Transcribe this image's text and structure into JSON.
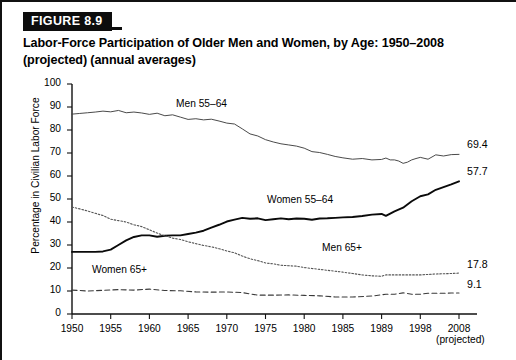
{
  "figure": {
    "badge": "FIGURE 8.9",
    "title_line1": "Labor-Force Participation of Older Men and Women, by Age: 1950–2008",
    "title_line2": "(projected) (annual averages)"
  },
  "chart_data": {
    "type": "line",
    "title": "Labor-Force Participation of Older Men and Women, by Age: 1950–2008 (projected) (annual averages)",
    "xlabel": "",
    "ylabel": "Percentage in Civilian Labor Force",
    "ylim": [
      0,
      100
    ],
    "yticks": [
      0,
      10,
      20,
      30,
      40,
      50,
      60,
      70,
      80,
      90,
      100
    ],
    "xtick_labels": [
      "1950",
      "1955",
      "1960",
      "1965",
      "1970",
      "1975",
      "1980",
      "1985",
      "1989",
      "1998",
      "2008"
    ],
    "xtick_sublabel_last": "(projected)",
    "grid": false,
    "legend": "inline-labels",
    "series": [
      {
        "name": "Men 55–64",
        "style": "solid-thin",
        "color": "#404040",
        "end_value": 69.4,
        "label_position": "inline",
        "x": [
          1950,
          1951,
          1952,
          1953,
          1954,
          1955,
          1956,
          1957,
          1958,
          1959,
          1960,
          1961,
          1962,
          1963,
          1964,
          1965,
          1966,
          1967,
          1968,
          1969,
          1970,
          1971,
          1972,
          1973,
          1974,
          1975,
          1976,
          1977,
          1978,
          1979,
          1980,
          1981,
          1982,
          1983,
          1984,
          1985,
          1986,
          1987,
          1988,
          1989,
          1990,
          1991,
          1992,
          1993,
          1994,
          1995,
          1996,
          1997,
          1998,
          2000,
          2002,
          2004,
          2006,
          2008
        ],
        "values": [
          86.9,
          87.2,
          87.5,
          87.8,
          88.2,
          87.9,
          88.5,
          87.5,
          87.8,
          87.4,
          86.8,
          87.3,
          86.2,
          86.6,
          85.6,
          84.6,
          84.9,
          84.4,
          84.7,
          83.9,
          83.0,
          82.6,
          80.5,
          78.3,
          77.4,
          75.8,
          74.8,
          74.0,
          73.5,
          73.0,
          72.1,
          70.6,
          70.2,
          69.4,
          68.5,
          67.9,
          67.3,
          67.6,
          67.0,
          67.2,
          67.8,
          67.0,
          67.0,
          66.5,
          65.5,
          66.0,
          67.0,
          67.6,
          68.1,
          67.3,
          69.2,
          68.7,
          69.3,
          69.4
        ]
      },
      {
        "name": "Women 55–64",
        "style": "solid-thick",
        "color": "#0a0a0a",
        "end_value": 57.7,
        "label_position": "inline",
        "x": [
          1950,
          1951,
          1952,
          1953,
          1954,
          1955,
          1956,
          1957,
          1958,
          1959,
          1960,
          1961,
          1962,
          1963,
          1964,
          1965,
          1966,
          1967,
          1968,
          1969,
          1970,
          1971,
          1972,
          1973,
          1974,
          1975,
          1976,
          1977,
          1978,
          1979,
          1980,
          1981,
          1982,
          1983,
          1984,
          1985,
          1986,
          1987,
          1988,
          1989,
          1990,
          1992,
          1994,
          1996,
          1998,
          2000,
          2002,
          2004,
          2006,
          2008
        ],
        "values": [
          27.0,
          27.0,
          27.0,
          27.0,
          27.2,
          28.0,
          30.0,
          32.0,
          33.5,
          34.2,
          34.2,
          33.6,
          34.0,
          34.2,
          34.2,
          34.8,
          35.4,
          36.2,
          37.6,
          38.8,
          40.2,
          41.0,
          41.8,
          41.4,
          41.6,
          40.8,
          41.2,
          41.6,
          41.2,
          41.5,
          41.4,
          41.0,
          41.5,
          41.6,
          41.8,
          42.0,
          42.2,
          42.6,
          43.2,
          43.5,
          42.7,
          44.6,
          46.2,
          49.0,
          51.2,
          52.0,
          54.0,
          55.2,
          56.4,
          57.7
        ]
      },
      {
        "name": "Men 65+",
        "style": "dotted",
        "color": "#555555",
        "end_value": 17.8,
        "label_position": "inline",
        "x": [
          1950,
          1951,
          1952,
          1953,
          1954,
          1955,
          1956,
          1957,
          1958,
          1959,
          1960,
          1961,
          1962,
          1963,
          1964,
          1965,
          1966,
          1967,
          1968,
          1969,
          1970,
          1971,
          1972,
          1973,
          1974,
          1975,
          1976,
          1977,
          1978,
          1979,
          1980,
          1981,
          1982,
          1983,
          1984,
          1985,
          1986,
          1987,
          1988,
          1989,
          1990,
          1992,
          1994,
          1996,
          1998,
          2000,
          2002,
          2004,
          2006,
          2008
        ],
        "values": [
          46.5,
          45.7,
          44.8,
          43.8,
          42.8,
          41.2,
          40.6,
          40.0,
          38.8,
          38.0,
          36.6,
          35.2,
          34.0,
          33.0,
          32.4,
          31.4,
          30.6,
          29.8,
          29.2,
          28.4,
          27.4,
          26.6,
          25.2,
          24.0,
          23.2,
          22.2,
          21.8,
          21.2,
          21.0,
          20.8,
          20.2,
          19.8,
          19.4,
          19.0,
          18.6,
          18.2,
          17.6,
          17.0,
          16.6,
          16.4,
          17.0,
          17.0,
          17.0,
          17.0,
          17.0,
          17.2,
          17.4,
          17.5,
          17.6,
          17.8
        ]
      },
      {
        "name": "Women 65+",
        "style": "dashed",
        "color": "#3a3a3a",
        "end_value": 9.1,
        "label_position": "inline",
        "x": [
          1950,
          1952,
          1954,
          1956,
          1958,
          1960,
          1962,
          1964,
          1966,
          1968,
          1970,
          1972,
          1974,
          1976,
          1978,
          1980,
          1982,
          1984,
          1986,
          1988,
          1990,
          1992,
          1994,
          1996,
          1998,
          2000,
          2002,
          2004,
          2006,
          2008
        ],
        "values": [
          10.4,
          10.0,
          10.3,
          10.6,
          10.4,
          10.8,
          10.2,
          10.1,
          9.6,
          9.5,
          9.6,
          9.3,
          8.2,
          8.2,
          8.3,
          8.1,
          7.9,
          7.4,
          7.4,
          7.8,
          8.6,
          8.6,
          9.2,
          8.6,
          8.6,
          9.0,
          9.0,
          9.0,
          9.1,
          9.1
        ]
      }
    ],
    "end_labels": [
      {
        "text": "69.4",
        "series": "Men 55–64"
      },
      {
        "text": "57.7",
        "series": "Women 55–64"
      },
      {
        "text": "17.8",
        "series": "Men 65+"
      },
      {
        "text": "9.1",
        "series": "Women 65+"
      }
    ],
    "inline_labels": [
      {
        "text": "Men 55–64"
      },
      {
        "text": "Women 55–64"
      },
      {
        "text": "Men 65+"
      },
      {
        "text": "Women 65+"
      }
    ]
  }
}
